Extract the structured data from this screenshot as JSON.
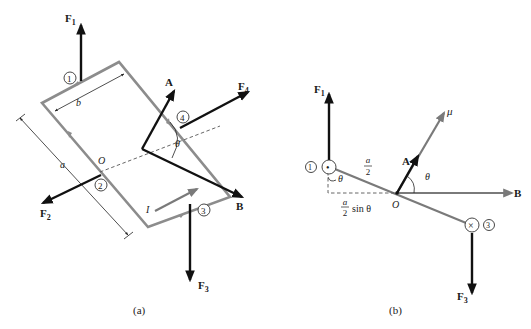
{
  "figure": {
    "panel_a": {
      "caption": "(a)",
      "vectors": {
        "F1": {
          "main": "F",
          "sub": "1"
        },
        "F2": {
          "main": "F",
          "sub": "2"
        },
        "F3": {
          "main": "F",
          "sub": "3"
        },
        "F4": {
          "main": "F",
          "sub": "4"
        },
        "A": "A",
        "B": "B"
      },
      "side_markers": [
        "1",
        "2",
        "3",
        "4"
      ],
      "dimensions": {
        "a": "a",
        "b": "b"
      },
      "origin": "O",
      "angle": "θ",
      "current": "I"
    },
    "panel_b": {
      "caption": "(b)",
      "vectors": {
        "F1": {
          "main": "F",
          "sub": "1"
        },
        "F3": {
          "main": "F",
          "sub": "3"
        },
        "A": "A",
        "B": "B",
        "mu": "μ"
      },
      "side_markers": [
        "1",
        "3"
      ],
      "current_out_symbol": "•",
      "current_in_symbol": "×",
      "half_length": {
        "num": "a",
        "den": "2"
      },
      "lever_arm": {
        "num": "a",
        "den": "2",
        "suffix": "sin θ"
      },
      "origin": "O",
      "angle_top": "θ",
      "angle_left": "θ"
    },
    "colors": {
      "loop": "#8c8c8c",
      "force": "#111111",
      "moment": "#7a7a7a",
      "background": "#ffffff"
    }
  }
}
